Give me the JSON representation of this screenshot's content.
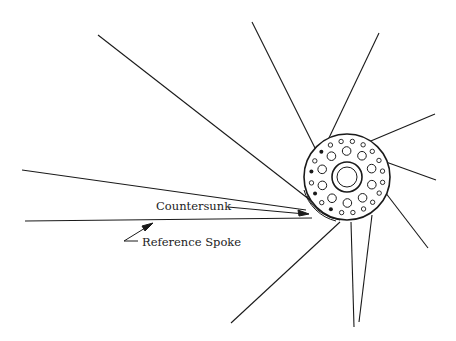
{
  "diagram": {
    "labels": {
      "countersunk": "Countersunk",
      "reference_spoke": "Reference Spoke"
    },
    "colors": {
      "line": "#1a1a1a",
      "background": "#ffffff"
    },
    "hub": {
      "cx": 347,
      "cy": 177,
      "r": 43
    },
    "spokes": [
      {
        "x1": 98,
        "y1": 35,
        "x2": 310,
        "y2": 200
      },
      {
        "x1": 252,
        "y1": 22,
        "x2": 320,
        "y2": 158
      },
      {
        "x1": 379,
        "y1": 33,
        "x2": 328,
        "y2": 140
      },
      {
        "x1": 435,
        "y1": 114,
        "x2": 366,
        "y2": 143
      },
      {
        "x1": 436,
        "y1": 180,
        "x2": 386,
        "y2": 162
      },
      {
        "x1": 428,
        "y1": 248,
        "x2": 385,
        "y2": 192
      },
      {
        "x1": 22,
        "y1": 170,
        "x2": 306,
        "y2": 210
      },
      {
        "x1": 25,
        "y1": 221,
        "x2": 312,
        "y2": 218
      },
      {
        "x1": 231,
        "y1": 323,
        "x2": 340,
        "y2": 222
      },
      {
        "x1": 354,
        "y1": 327,
        "x2": 351,
        "y2": 222
      },
      {
        "x1": 359,
        "y1": 322,
        "x2": 372,
        "y2": 215
      }
    ]
  }
}
